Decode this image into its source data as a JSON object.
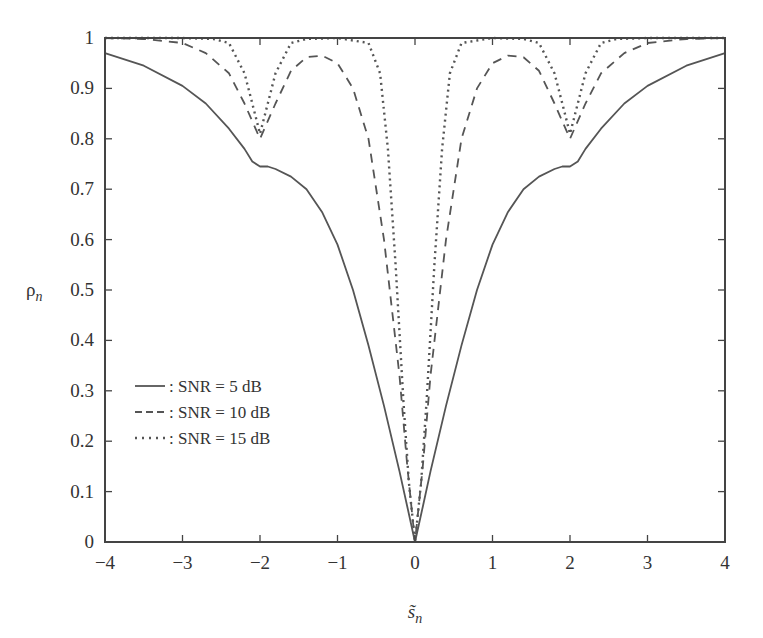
{
  "chart_data": {
    "type": "line",
    "title": "",
    "xlabel": "s̃_n",
    "ylabel": "ρ_n",
    "xlim": [
      -4,
      4
    ],
    "ylim": [
      0,
      1
    ],
    "xticks": [
      -4,
      -3,
      -2,
      -1,
      0,
      1,
      2,
      3,
      4
    ],
    "xtick_labels": [
      "−4",
      "−3",
      "−2",
      "−1",
      "0",
      "1",
      "2",
      "3",
      "4"
    ],
    "yticks": [
      0,
      0.1,
      0.2,
      0.3,
      0.4,
      0.5,
      0.6,
      0.7,
      0.8,
      0.9,
      1
    ],
    "ytick_labels": [
      "0",
      "0.1",
      "0.2",
      "0.3",
      "0.4",
      "0.5",
      "0.6",
      "0.7",
      "0.8",
      "0.9",
      "1"
    ],
    "grid": false,
    "legend_position": "lower-left inside",
    "series": [
      {
        "name": ": SNR = 5 dB",
        "style": "solid",
        "x": [
          -4,
          -3.5,
          -3,
          -2.7,
          -2.4,
          -2.2,
          -2.1,
          -2.0,
          -1.9,
          -1.8,
          -1.6,
          -1.4,
          -1.2,
          -1.0,
          -0.8,
          -0.6,
          -0.4,
          -0.2,
          -0.1,
          0,
          0.1,
          0.2,
          0.4,
          0.6,
          0.8,
          1.0,
          1.2,
          1.4,
          1.6,
          1.8,
          1.9,
          2.0,
          2.1,
          2.2,
          2.4,
          2.7,
          3,
          3.5,
          4
        ],
        "y": [
          0.97,
          0.945,
          0.905,
          0.87,
          0.82,
          0.78,
          0.755,
          0.745,
          0.745,
          0.74,
          0.725,
          0.7,
          0.655,
          0.59,
          0.5,
          0.39,
          0.27,
          0.14,
          0.07,
          0.0,
          0.07,
          0.14,
          0.27,
          0.39,
          0.5,
          0.59,
          0.655,
          0.7,
          0.725,
          0.74,
          0.745,
          0.745,
          0.755,
          0.78,
          0.82,
          0.87,
          0.905,
          0.945,
          0.97
        ]
      },
      {
        "name": ": SNR = 10 dB",
        "style": "dashed",
        "x": [
          -4,
          -3.5,
          -3,
          -2.7,
          -2.4,
          -2.2,
          -2.0,
          -1.8,
          -1.6,
          -1.4,
          -1.2,
          -1.0,
          -0.8,
          -0.6,
          -0.4,
          -0.2,
          -0.1,
          0,
          0.1,
          0.2,
          0.4,
          0.6,
          0.8,
          1.0,
          1.2,
          1.4,
          1.6,
          1.8,
          2.0,
          2.2,
          2.4,
          2.7,
          3,
          3.5,
          4
        ],
        "y": [
          1.0,
          0.998,
          0.99,
          0.97,
          0.93,
          0.87,
          0.8,
          0.87,
          0.935,
          0.962,
          0.965,
          0.95,
          0.9,
          0.8,
          0.6,
          0.33,
          0.15,
          0.0,
          0.15,
          0.33,
          0.6,
          0.8,
          0.9,
          0.95,
          0.965,
          0.962,
          0.935,
          0.87,
          0.8,
          0.87,
          0.93,
          0.97,
          0.99,
          0.998,
          1.0
        ]
      },
      {
        "name": ": SNR = 15 dB",
        "style": "dotted",
        "x": [
          -4,
          -3,
          -2.6,
          -2.4,
          -2.2,
          -2.1,
          -2.0,
          -1.9,
          -1.8,
          -1.6,
          -1.4,
          -1.0,
          -0.6,
          -0.45,
          -0.35,
          -0.25,
          -0.15,
          -0.08,
          0,
          0.08,
          0.15,
          0.25,
          0.35,
          0.45,
          0.6,
          1.0,
          1.4,
          1.6,
          1.8,
          1.9,
          2.0,
          2.1,
          2.2,
          2.4,
          2.6,
          3,
          4
        ],
        "y": [
          1.0,
          1.0,
          0.998,
          0.99,
          0.93,
          0.87,
          0.81,
          0.87,
          0.93,
          0.99,
          0.998,
          1.0,
          0.99,
          0.93,
          0.78,
          0.55,
          0.28,
          0.12,
          0.0,
          0.12,
          0.28,
          0.55,
          0.78,
          0.93,
          0.99,
          1.0,
          0.998,
          0.99,
          0.93,
          0.87,
          0.81,
          0.87,
          0.93,
          0.99,
          0.998,
          1.0,
          1.0
        ]
      }
    ]
  },
  "plot_area": {
    "left": 105,
    "right": 725,
    "top": 38,
    "bottom": 542
  },
  "colors": {
    "axis": "#444444",
    "line": "#555555",
    "text": "#333333"
  }
}
